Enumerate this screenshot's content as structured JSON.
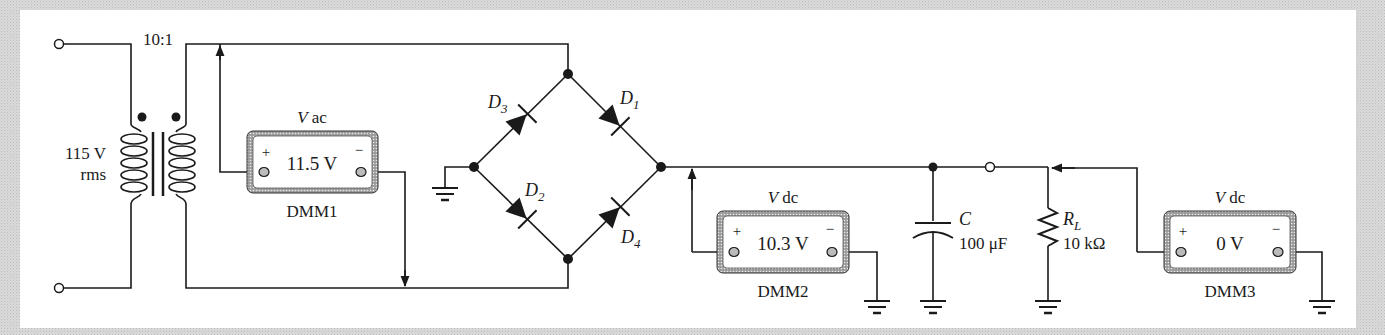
{
  "diagram": {
    "type": "full-wave bridge rectifier with capacitor filter",
    "source": {
      "voltage_label": "115 V",
      "voltage_sub": "rms"
    },
    "transformer": {
      "ratio_label": "10:1"
    },
    "diodes": [
      {
        "name": "D",
        "sub": "1"
      },
      {
        "name": "D",
        "sub": "2"
      },
      {
        "name": "D",
        "sub": "3"
      },
      {
        "name": "D",
        "sub": "4"
      }
    ],
    "capacitor": {
      "name": "C",
      "value": "100 μF"
    },
    "resistor": {
      "name": "R",
      "sub": "L",
      "value": "10 kΩ"
    },
    "meters": [
      {
        "id": "DMM1",
        "mode_v": "V",
        "mode": "ac",
        "reading": "11.5 V",
        "plus": "+",
        "minus": "−"
      },
      {
        "id": "DMM2",
        "mode_v": "V",
        "mode": "dc",
        "reading": "10.3 V",
        "plus": "+",
        "minus": "−"
      },
      {
        "id": "DMM3",
        "mode_v": "V",
        "mode": "dc",
        "reading": "0 V",
        "plus": "+",
        "minus": "−"
      }
    ]
  }
}
